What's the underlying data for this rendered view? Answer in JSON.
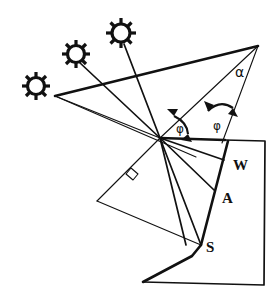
{
  "figure": {
    "background_color": "#ffffff",
    "line_color": "#111111",
    "labels": {
      "alpha": "α",
      "phi_left": "φ",
      "phi_right": "φ",
      "wall": "W",
      "aperture": "A",
      "surface": "S"
    },
    "icons": {
      "sun_1": "sun-icon",
      "sun_2": "sun-icon",
      "sun_3": "sun-icon",
      "right_angle": "right-angle-marker-icon",
      "arc_alpha": "angle-arc-icon",
      "arc_phi": "angle-arc-icon"
    },
    "suns": [
      {
        "name": "sun-low",
        "cx": 36,
        "cy": 86,
        "r": 11,
        "rays": 8
      },
      {
        "name": "sun-mid",
        "cx": 76,
        "cy": 54,
        "r": 11,
        "rays": 8
      },
      {
        "name": "sun-high",
        "cx": 121,
        "cy": 33,
        "r": 12,
        "rays": 8
      }
    ],
    "points": {
      "vertex": {
        "x": 160,
        "y": 138
      },
      "apex": {
        "x": 258,
        "y": 46
      },
      "sun_origin": {
        "x": 55,
        "y": 96
      },
      "w": {
        "x": 228,
        "y": 166
      },
      "a": {
        "x": 217,
        "y": 195
      },
      "s": {
        "x": 201,
        "y": 245
      },
      "normal_end": {
        "x": 97,
        "y": 201
      },
      "box_top_right": {
        "x": 265,
        "y": 141
      },
      "box_bottom_right": {
        "x": 264,
        "y": 285
      },
      "box_bottom_left": {
        "x": 143,
        "y": 282
      }
    }
  }
}
